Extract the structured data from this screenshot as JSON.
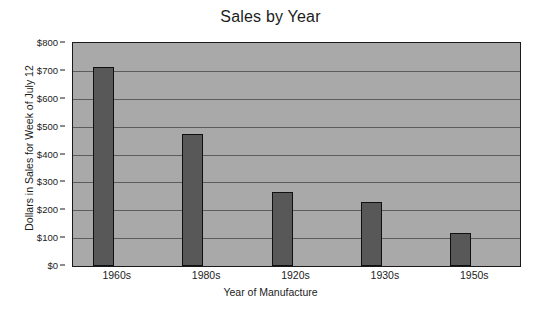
{
  "chart_data": {
    "type": "bar",
    "title": "Sales by Year",
    "xlabel": "Year of Manufacture",
    "ylabel": "Dollars in Sales for Week of July 12",
    "categories": [
      "1960s",
      "1980s",
      "1920s",
      "1930s",
      "1950s"
    ],
    "values": [
      715,
      475,
      265,
      228,
      120
    ],
    "ylim": [
      0,
      800
    ],
    "ytick_values": [
      0,
      100,
      200,
      300,
      400,
      500,
      600,
      700,
      800
    ],
    "ytick_labels": [
      "$0",
      "$100",
      "$200",
      "$300",
      "$400",
      "$500",
      "$600",
      "$700",
      "$800"
    ],
    "grid": true,
    "legend": false,
    "plot_background_color": "#a9a9a9",
    "bar_color": "#585858",
    "bar_edge_color": "#101010",
    "gridline_color": "#5c5c5c",
    "text_color": "#1c1c1c"
  }
}
